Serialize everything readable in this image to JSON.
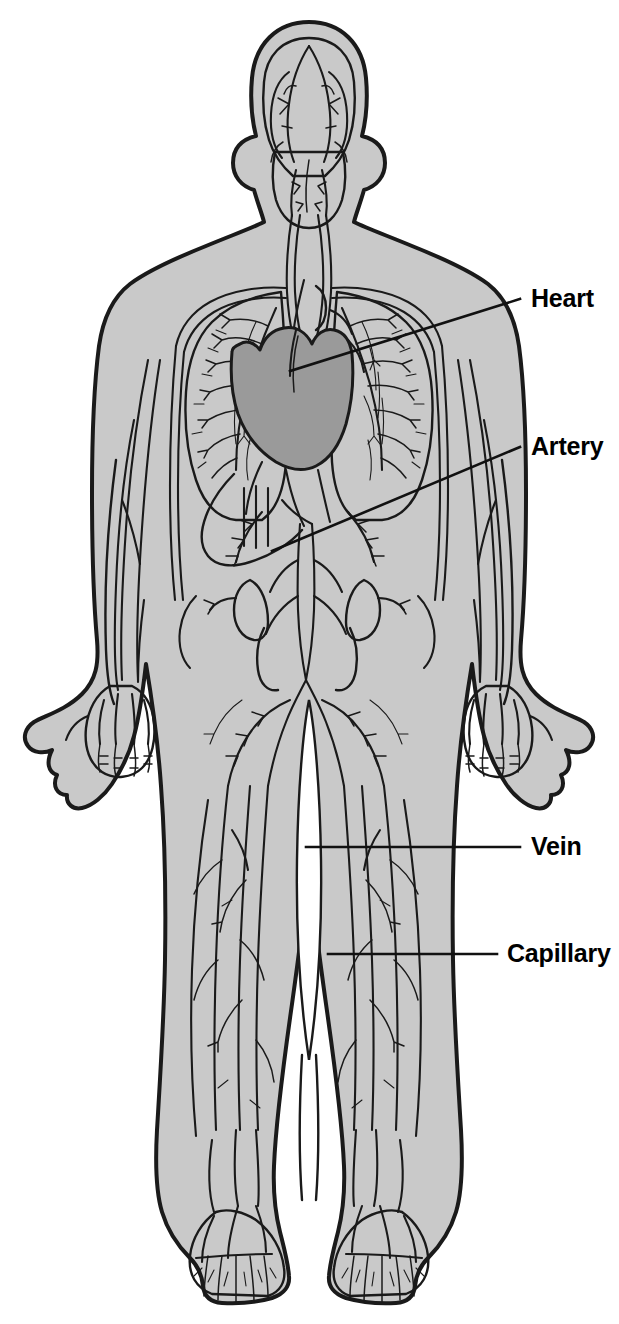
{
  "figure": {
    "background_color": "#ffffff",
    "body_fill_color": "#c9c9c9",
    "body_outline_color": "#1a1a1a",
    "vessel_color": "#1a1a1a",
    "heart_fill_color": "#9a9a9a",
    "label_color": "#000000",
    "leader_line_color": "#111111"
  },
  "labels": [
    {
      "id": "heart",
      "text": "Heart",
      "x": 531,
      "y": 286,
      "leader": {
        "type": "diagonal",
        "x1": 290,
        "y1": 371,
        "x2": 520,
        "y2": 299
      }
    },
    {
      "id": "artery",
      "text": "Artery",
      "x": 531,
      "y": 434,
      "leader": {
        "type": "diagonal",
        "x1": 272,
        "y1": 551,
        "x2": 520,
        "y2": 447
      }
    },
    {
      "id": "vein",
      "text": "Vein",
      "x": 531,
      "y": 834,
      "leader": {
        "type": "horizontal",
        "x1": 306,
        "y1": 847,
        "x2": 520,
        "y2": 847
      }
    },
    {
      "id": "capillary",
      "text": "Capillary",
      "x": 507,
      "y": 941,
      "leader": {
        "type": "horizontal",
        "x1": 328,
        "y1": 954,
        "x2": 497,
        "y2": 954
      }
    }
  ],
  "anatomy_parts": [
    "head",
    "neck",
    "torso",
    "left-arm",
    "right-arm",
    "left-hand",
    "right-hand",
    "left-leg",
    "right-leg",
    "left-foot",
    "right-foot"
  ],
  "vessel_regions": [
    "cranial-vessels",
    "carotid-arteries",
    "jugular-veins",
    "pulmonary-vascular-tree",
    "aortic-arch",
    "abdominal-aorta",
    "iliac-vessels",
    "femoral-vessels",
    "brachial-vessels",
    "hand-capillary-network",
    "foot-capillary-network"
  ]
}
